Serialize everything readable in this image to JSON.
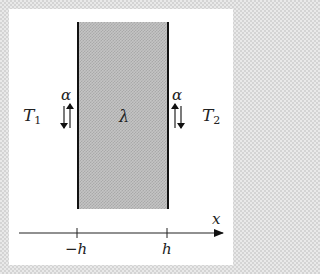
{
  "diagram": {
    "slab": {
      "label": "λ",
      "fill": "#c0c0c0",
      "wall_color": "#111111"
    },
    "left": {
      "temperature_label": "T",
      "temperature_sub": "1",
      "coefficient_label": "α",
      "arrows": [
        "down (outer)",
        "up (inner, at wall)"
      ]
    },
    "right": {
      "temperature_label": "T",
      "temperature_sub": "2",
      "coefficient_label": "α",
      "arrows": [
        "up (inner, at wall)",
        "down (outer)"
      ]
    },
    "axis": {
      "label": "x",
      "ticks": [
        {
          "label": "−h",
          "position": -1
        },
        {
          "label": "h",
          "position": 1
        }
      ],
      "direction": "right"
    }
  }
}
